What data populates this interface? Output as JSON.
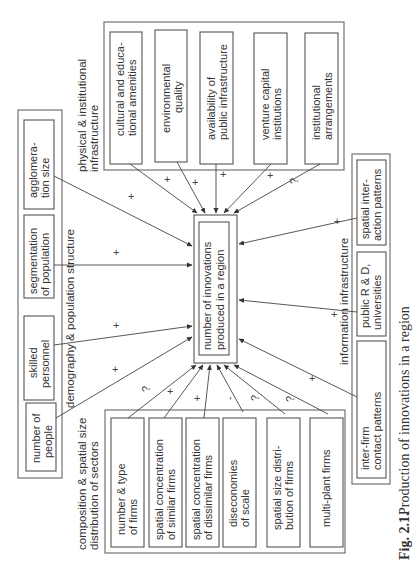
{
  "figure": {
    "number": "Fig. 2.1.",
    "caption": "Production of innovations in a region"
  },
  "center": {
    "line1": "number of innovations",
    "line2": "produced in a region"
  },
  "groups": {
    "physical": {
      "label1": "physical & institutional",
      "label2": "infrastructure",
      "items": [
        {
          "l1": "cultural and educa-",
          "l2": "tional amenities",
          "sign": "+"
        },
        {
          "l1": "environmental",
          "l2": "quality",
          "sign": "+"
        },
        {
          "l1": "availability of",
          "l2": "public infrastructure",
          "sign": "+"
        },
        {
          "l1": "venture capital",
          "l2": "institutions",
          "sign": "+"
        },
        {
          "l1": "institutional",
          "l2": "arrangements",
          "sign": "?"
        }
      ]
    },
    "demography": {
      "label": "demography & population structure",
      "items": [
        {
          "l1": "agglomera-",
          "l2": "tion size",
          "sign": "+"
        },
        {
          "l1": "segmentation",
          "l2": "of population",
          "sign": "+"
        },
        {
          "l1": "skilled",
          "l2": "personnel",
          "sign": "+"
        },
        {
          "l1": "number of",
          "l2": "people",
          "sign": "+"
        }
      ]
    },
    "composition": {
      "label1": "composition & spatial size",
      "label2": "distribution of sectors",
      "items": [
        {
          "l1": "number & type",
          "l2": "of firms",
          "sign": "?"
        },
        {
          "l1": "spatial concentration",
          "l2": "of similar firms",
          "sign": "+"
        },
        {
          "l1": "spatial concentration",
          "l2": "of dissimilar firms",
          "sign": "+"
        },
        {
          "l1": "diseconomies",
          "l2": "of scale",
          "sign": "-"
        },
        {
          "l1": "spatial size distri-",
          "l2": "bution of firms",
          "sign": "?"
        },
        {
          "l1": "multi-plant firms",
          "l2": "",
          "sign": "?"
        }
      ]
    },
    "information": {
      "label": "information infrastructure",
      "items": [
        {
          "l1": "spatial inter-",
          "l2": "action patterns",
          "sign": "+"
        },
        {
          "l1": "public R & D,",
          "l2": "universities",
          "sign": "+"
        },
        {
          "l1": "inter-firm",
          "l2": "contact patterns",
          "sign": "+"
        }
      ]
    }
  }
}
